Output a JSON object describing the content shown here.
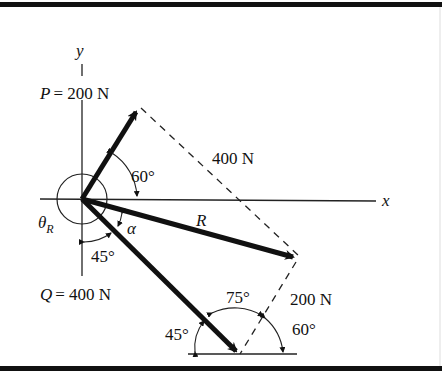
{
  "figure": {
    "axes": {
      "x_label": "x",
      "y_label": "y"
    },
    "forces": {
      "P": {
        "label": "P = 200 N",
        "magnitude_N": 200,
        "angle_from_x_deg": 60
      },
      "Q": {
        "label": "Q = 400 N",
        "magnitude_N": 400,
        "angle_below_x_deg": 45
      },
      "R": {
        "label": "R"
      }
    },
    "parallelogram_labels": {
      "side_Q": "400 N",
      "side_P": "200 N"
    },
    "angles": {
      "p_angle": "60°",
      "q_angle_origin": "45°",
      "alpha": "α",
      "theta_r": "θ",
      "theta_r_sub": "R",
      "tri_left": "45°",
      "tri_top": "75°",
      "tri_right": "60°"
    },
    "colors": {
      "ink": "#111111",
      "background": "#ffffff"
    }
  }
}
